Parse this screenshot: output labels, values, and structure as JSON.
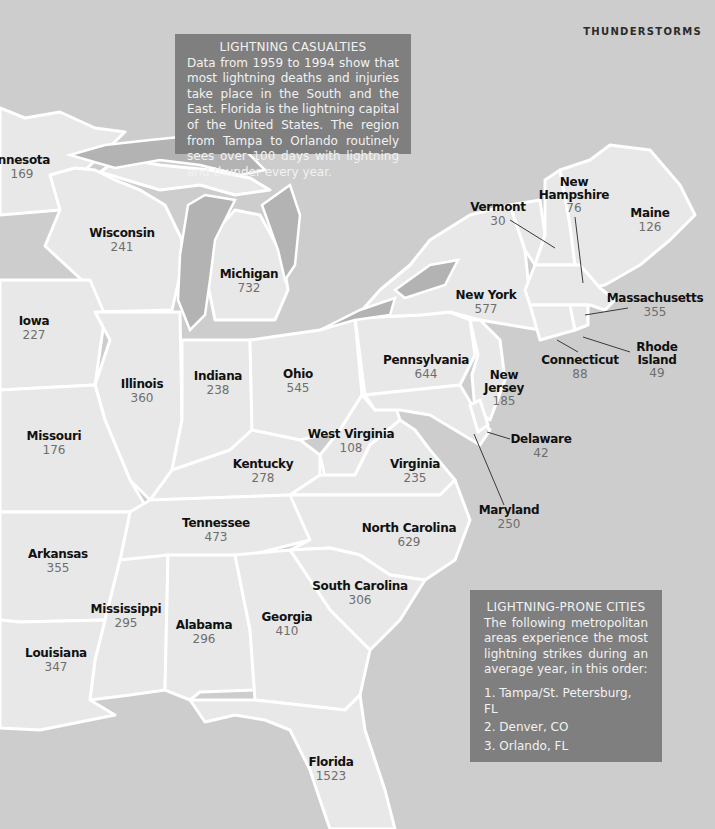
{
  "header": {
    "section_title": "THUNDERSTORMS"
  },
  "colors": {
    "water": "#cdcdcd",
    "land": "#e8e8e8",
    "lakes": "#b3b3b3",
    "borders": "#ffffff",
    "info_box": "#7f7f7f",
    "info_text": "#f2f2f2",
    "state_name": "#111111",
    "state_count": "#6e6e6e"
  },
  "casualties_box": {
    "title": "LIGHTNING CASUALTIES",
    "body": "Data from 1959 to 1994 show that most lightning deaths and injuries take place in the South and the East. Florida is the lightning capital of the United States. The region from Tampa to Orlando routinely sees over 100 days with lightning and thunder every year."
  },
  "cities_box": {
    "title": "LIGHTNING-PRONE CITIES",
    "body": "The following metropolitan areas experience the most lightning strikes during an average year, in this order:",
    "cities": [
      "1. Tampa/St. Petersburg, FL",
      "2. Denver, CO",
      "3. Orlando, FL"
    ]
  },
  "states": [
    {
      "name": "innesota",
      "count": "169"
    },
    {
      "name": "Wisconsin",
      "count": "241"
    },
    {
      "name": "Michigan",
      "count": "732"
    },
    {
      "name": "Iowa",
      "count": "227"
    },
    {
      "name": "Illinois",
      "count": "360"
    },
    {
      "name": "Indiana",
      "count": "238"
    },
    {
      "name": "Ohio",
      "count": "545"
    },
    {
      "name": "Missouri",
      "count": "176"
    },
    {
      "name": "Kentucky",
      "count": "278"
    },
    {
      "name": "West Virginia",
      "count": "108"
    },
    {
      "name": "Virginia",
      "count": "235"
    },
    {
      "name": "Pennsylvania",
      "count": "644"
    },
    {
      "name": "New York",
      "count": "577"
    },
    {
      "name": "Vermont",
      "count": "30"
    },
    {
      "name": "New Hampshire",
      "count": "76"
    },
    {
      "name": "Maine",
      "count": "126"
    },
    {
      "name": "Massachusetts",
      "count": "355"
    },
    {
      "name": "Connecticut",
      "count": "88"
    },
    {
      "name": "Rhode Island",
      "count": "49"
    },
    {
      "name": "New Jersey",
      "count": "185"
    },
    {
      "name": "Delaware",
      "count": "42"
    },
    {
      "name": "Maryland",
      "count": "250"
    },
    {
      "name": "Tennessee",
      "count": "473"
    },
    {
      "name": "North Carolina",
      "count": "629"
    },
    {
      "name": "Arkansas",
      "count": "355"
    },
    {
      "name": "South Carolina",
      "count": "306"
    },
    {
      "name": "Mississippi",
      "count": "295"
    },
    {
      "name": "Alabama",
      "count": "296"
    },
    {
      "name": "Georgia",
      "count": "410"
    },
    {
      "name": "Louisiana",
      "count": "347"
    },
    {
      "name": "Florida",
      "count": "1523"
    }
  ]
}
